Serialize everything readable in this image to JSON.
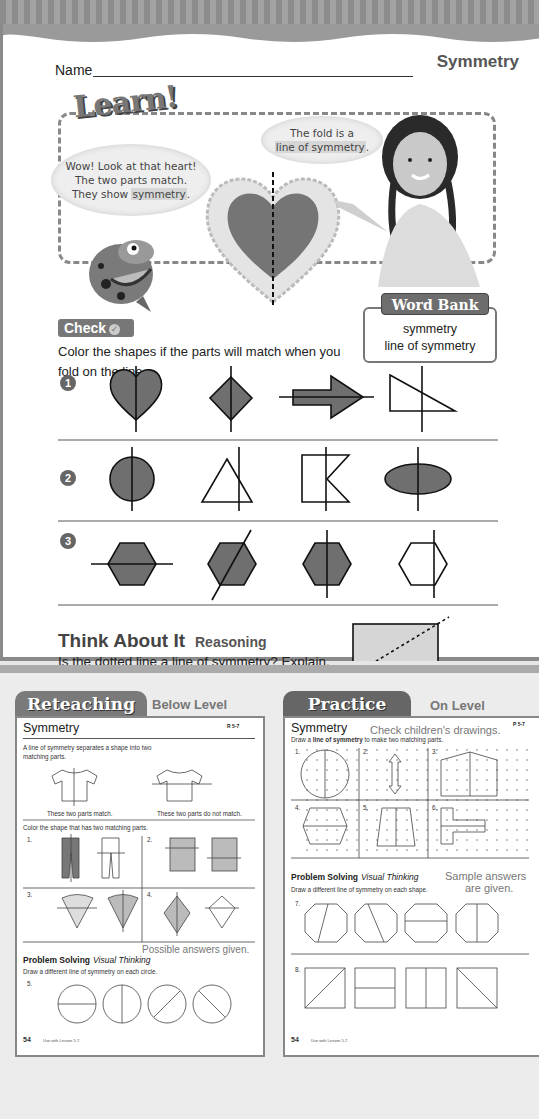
{
  "page": {
    "name_label": "Name",
    "lesson_title": "Symmetry",
    "learn": {
      "logo": "Learn!",
      "bubble_left": [
        "Wow! Look at that heart!",
        "The two parts match.",
        "They show "
      ],
      "bubble_left_highlight": "symmetry",
      "bubble_left_end": ".",
      "bubble_right": [
        "The fold is a"
      ],
      "bubble_right_highlight": "line of symmetry",
      "bubble_right_end": ".",
      "word_bank_title": "Word Bank",
      "word_bank_items": [
        "symmetry",
        "line of symmetry"
      ]
    },
    "check": {
      "label": "Check",
      "icon": "checkmark-icon",
      "instructions": "Color the shapes if the parts will match when you fold on the line.",
      "rows": [
        {
          "number": "1",
          "shapes": [
            {
              "shape": "heart",
              "line": "vertical",
              "colored": true
            },
            {
              "shape": "diamond",
              "line": "vertical",
              "colored": true
            },
            {
              "shape": "arrow",
              "line": "horizontal",
              "colored": true
            },
            {
              "shape": "right-triangle",
              "line": "off-axis",
              "colored": false
            }
          ]
        },
        {
          "number": "2",
          "shapes": [
            {
              "shape": "circle",
              "line": "vertical",
              "colored": true
            },
            {
              "shape": "triangle",
              "line": "off-axis",
              "colored": false
            },
            {
              "shape": "notched-rectangle",
              "line": "off-axis",
              "colored": false
            },
            {
              "shape": "ellipse",
              "line": "vertical",
              "colored": true
            }
          ]
        },
        {
          "number": "3",
          "shapes": [
            {
              "shape": "hexagon",
              "line": "horizontal",
              "colored": true
            },
            {
              "shape": "hexagon",
              "line": "diagonal",
              "colored": true
            },
            {
              "shape": "hexagon",
              "line": "vertical",
              "colored": true
            },
            {
              "shape": "hexagon",
              "line": "off-axis",
              "colored": false
            }
          ]
        }
      ]
    },
    "think": {
      "title": "Think About It",
      "subtitle": "Reasoning",
      "question": "Is the dotted line a line of symmetry? Explain.",
      "answer_lines": [
        "No, when the rectangle is folded on the",
        "line the parts do not match."
      ]
    },
    "footer": {
      "chapter": "Chapter 5 ★ Lesson 7",
      "page_words": "one hundred seventy-one",
      "page_number": "171"
    }
  },
  "reteaching": {
    "tab": "Reteaching",
    "level": "Below Level",
    "title": "Symmetry",
    "code": "R 5-7",
    "intro": [
      "A line of symmetry separates a shape into two",
      "matching parts."
    ],
    "caption_match": "These two parts match.",
    "caption_nomatch": "These two parts do not match.",
    "color_instruction": "Color the shape that has two matching parts.",
    "items": [
      "1.",
      "2.",
      "3.",
      "4."
    ],
    "answer_note": "Possible answers given.",
    "problem_solving": "Problem Solving",
    "visual_thinking": "Visual Thinking",
    "ps_instruction": "Draw a different line of symmetry on each circle.",
    "ps_item": "5.",
    "page_num": "54",
    "use_with": "Use with Lesson 5-7."
  },
  "practice": {
    "tab": "Practice",
    "level": "On Level",
    "title": "Symmetry",
    "code": "P 5-7",
    "answer_note": "Check children's drawings.",
    "instruction_pre": "Draw a ",
    "instruction_bold": "line of symmetry",
    "instruction_post": " to make two matching parts.",
    "items": [
      "1.",
      "2.",
      "3.",
      "4.",
      "5.",
      "6."
    ],
    "problem_solving": "Problem Solving",
    "visual_thinking": "Visual Thinking",
    "sample_note_1": "Sample answers",
    "sample_note_2": "are given.",
    "ps_instruction": "Draw a different line of symmetry on each shape.",
    "ps_items": [
      "7.",
      "8."
    ],
    "page_num": "54",
    "use_with": "Use with Lesson 5-7."
  },
  "colors": {
    "fill_gray": "#6f6f6f",
    "line": "#111111",
    "accent_dark": "#666666"
  }
}
